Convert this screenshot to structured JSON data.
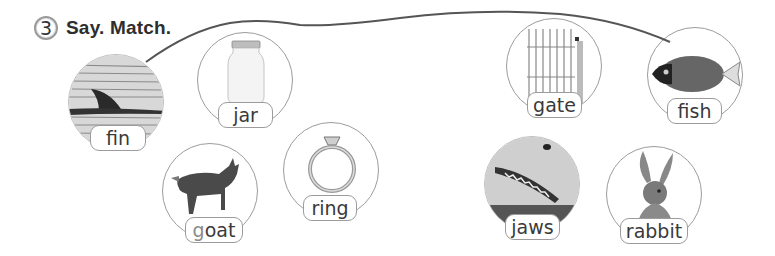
{
  "exercise": {
    "number": "3",
    "title": "Say. Match."
  },
  "items": [
    {
      "id": "fin",
      "word": "fin",
      "picture": "dolphin-fin-in-water"
    },
    {
      "id": "jar",
      "word": "jar",
      "picture": "glass-jar"
    },
    {
      "id": "goat",
      "word_first": "g",
      "word_rest": "oat",
      "picture": "goat"
    },
    {
      "id": "ring",
      "word": "ring",
      "picture": "diamond-ring"
    },
    {
      "id": "gate",
      "word": "gate",
      "picture": "iron-gate"
    },
    {
      "id": "fish",
      "word": "fish",
      "picture": "tropical-fish"
    },
    {
      "id": "jaws",
      "word": "jaws",
      "picture": "shark-jaws"
    },
    {
      "id": "rabbit",
      "word": "rabbit",
      "picture": "rabbit"
    }
  ],
  "match_line": {
    "from": "fin",
    "to": "fish",
    "color": "#555555"
  },
  "colors": {
    "border": "#9c9c9c",
    "highlight_letter": "#8a8a8a"
  }
}
